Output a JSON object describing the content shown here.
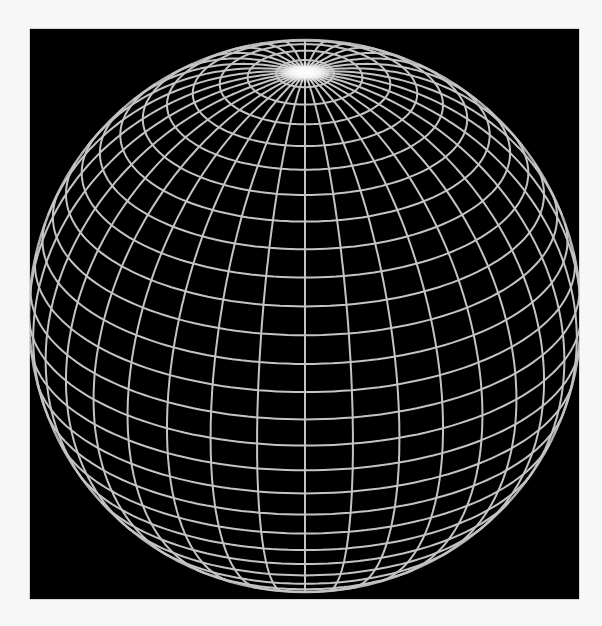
{
  "figure": {
    "description": "Wireframe globe with latitude and longitude grid lines on a black background, viewed from above the equator with the north pole visible near the top",
    "background_color": "#000000",
    "page_color": "#f7f7f7",
    "line_color": "#c4c4c4",
    "pole_glow_color": "#ffffff"
  },
  "globe": {
    "center_x": 305,
    "center_y": 316,
    "radius": 276,
    "view_elevation_deg": 28,
    "meridian_count": 36,
    "parallel_step_deg": 6,
    "line_width": 2
  }
}
